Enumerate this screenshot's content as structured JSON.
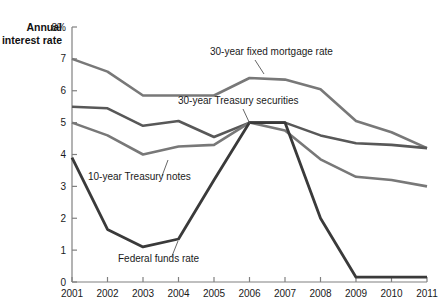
{
  "chart_data": {
    "type": "line",
    "title": "",
    "xlabel": "",
    "ylabel": "Annual interest rate",
    "ylabel_line1": "Annual",
    "ylabel_line2": "interest rate",
    "y_unit_label": "8%",
    "x": [
      2001,
      2002,
      2003,
      2004,
      2005,
      2006,
      2007,
      2008,
      2009,
      2010,
      2011
    ],
    "xlim": [
      2001,
      2011
    ],
    "ylim": [
      0,
      8
    ],
    "yticks": [
      0,
      1,
      2,
      3,
      4,
      5,
      6,
      7,
      8
    ],
    "ytick_labels": [
      "0",
      "1",
      "2",
      "3",
      "4",
      "5",
      "6",
      "7",
      "8%"
    ],
    "xtick_labels": [
      "2001",
      "2002",
      "2003",
      "2004",
      "2005",
      "2006",
      "2007",
      "2008",
      "2009",
      "2010",
      "2011"
    ],
    "grid": false,
    "legend_position": "inline-annotations",
    "series": [
      {
        "name": "30-year fixed mortgage rate",
        "color": "#787878",
        "width": 2.6,
        "values": [
          7.0,
          6.6,
          5.85,
          5.85,
          5.85,
          6.4,
          6.35,
          6.05,
          5.05,
          4.7,
          4.2
        ],
        "label_x": 210,
        "label_y": 55,
        "leader": [
          [
            255,
            60
          ],
          [
            264,
            74
          ]
        ]
      },
      {
        "name": "30-year Treasury securities",
        "color": "#585858",
        "width": 2.6,
        "values": [
          5.5,
          5.45,
          4.9,
          5.05,
          4.55,
          5.0,
          5.0,
          4.6,
          4.35,
          4.3,
          4.2
        ],
        "label_x": 178,
        "label_y": 104,
        "leader": [
          [
            243,
            109
          ],
          [
            250,
            124
          ]
        ]
      },
      {
        "name": "10-year Treasury notes",
        "color": "#787878",
        "width": 2.6,
        "values": [
          5.0,
          4.6,
          4.0,
          4.25,
          4.3,
          5.0,
          4.75,
          3.85,
          3.3,
          3.2,
          3.0
        ],
        "label_x": 88,
        "label_y": 180,
        "leader": [
          [
            162,
            176
          ],
          [
            168,
            160
          ]
        ]
      },
      {
        "name": "Federal funds rate",
        "color": "#3a3a3a",
        "width": 2.8,
        "values": [
          3.9,
          1.65,
          1.1,
          1.35,
          3.2,
          5.0,
          5.0,
          2.0,
          0.15,
          0.15,
          0.15
        ],
        "label_x": 118,
        "label_y": 262,
        "leader": [
          [
            172,
            256
          ],
          [
            178,
            241
          ]
        ]
      }
    ]
  }
}
